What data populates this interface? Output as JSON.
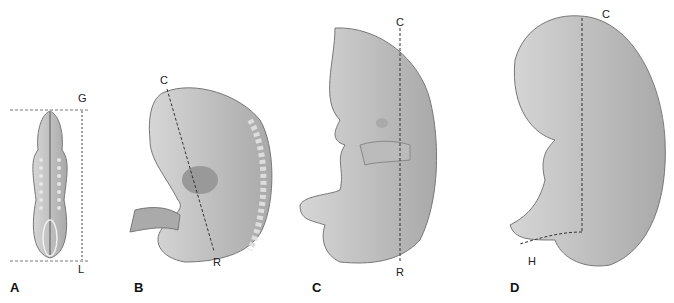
{
  "figure": {
    "panels": [
      {
        "id": "A",
        "label": "A",
        "points": {
          "top": "G",
          "bottom": "L"
        },
        "measure": "greatest length"
      },
      {
        "id": "B",
        "label": "B",
        "points": {
          "top": "C",
          "bottom": "R"
        },
        "measure": "crown-rump length"
      },
      {
        "id": "C",
        "label": "C",
        "points": {
          "top": "C",
          "bottom": "R"
        },
        "measure": "crown-rump length"
      },
      {
        "id": "D",
        "label": "D",
        "points": {
          "top": "C",
          "bottom": "H"
        },
        "measure": "crown-heel length"
      }
    ]
  },
  "colors": {
    "embryo_fill": "#c2c2c2",
    "embryo_dark": "#8a8a8a",
    "embryo_light": "#dcdcdc",
    "line": "#333333"
  }
}
